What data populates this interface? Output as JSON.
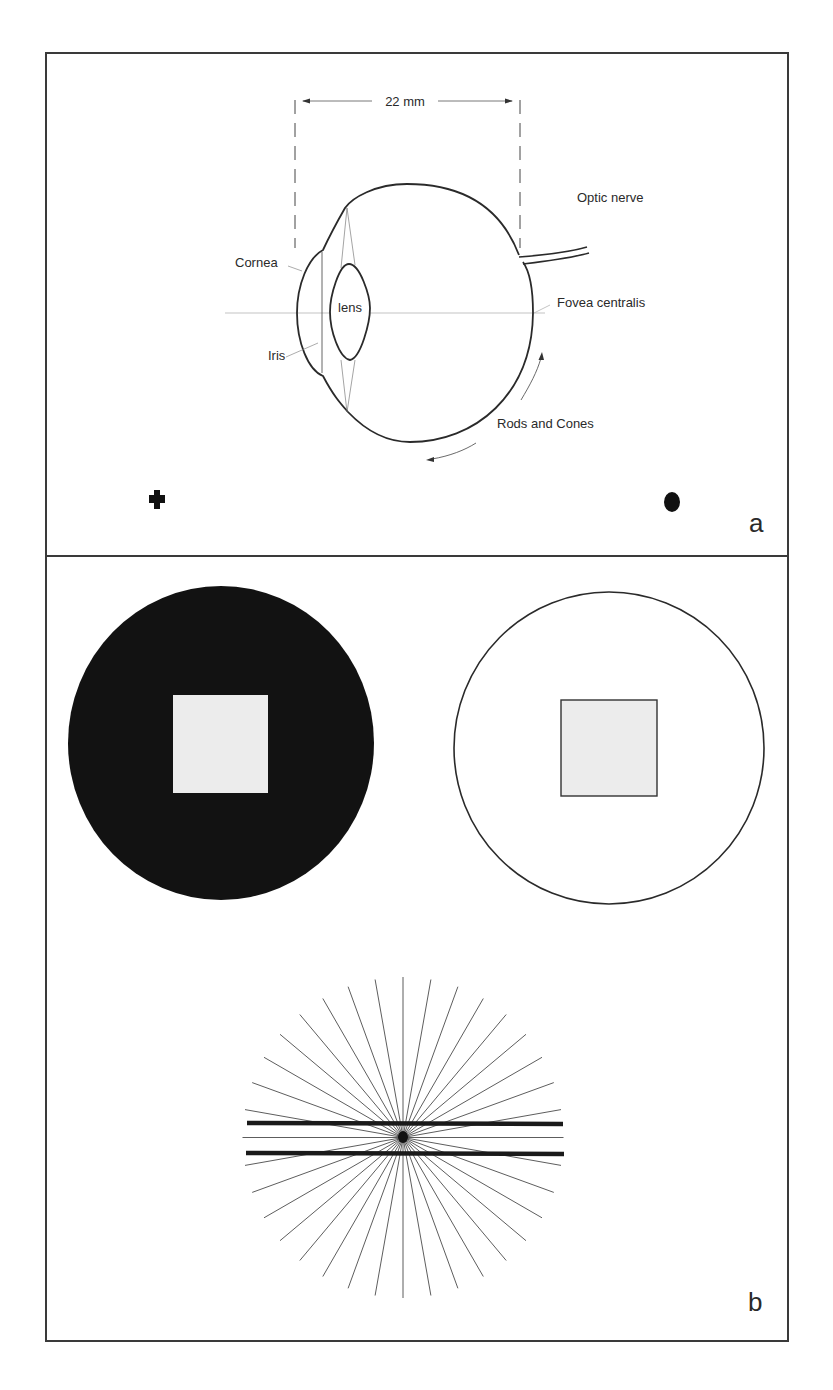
{
  "panel_a": {
    "letter": "a",
    "dimension_label": "22 mm",
    "labels": {
      "optic_nerve": "Optic nerve",
      "cornea": "Cornea",
      "lens": "lens",
      "fovea": "Fovea centralis",
      "iris": "Iris",
      "rods_cones": "Rods and Cones"
    },
    "markers": [
      "cross-marker",
      "dot-marker"
    ]
  },
  "panel_b": {
    "letter": "b",
    "left_disc": {
      "fill": "#111111",
      "square_fill": "#ececec"
    },
    "right_disc": {
      "fill": "#ffffff",
      "square_fill": "#ececec"
    },
    "radial_lines_count": 36,
    "parallel_bars_count": 2
  },
  "colors": {
    "frame": "#3a3a3a",
    "ink": "#222222",
    "thin_line": "#888888"
  }
}
